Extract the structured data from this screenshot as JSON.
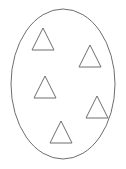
{
  "figure": {
    "background_color": "#ffffff",
    "stroke_color": "#6e6e6e",
    "fill_color": "none",
    "stroke_width": 1,
    "canvas": {
      "width": 126,
      "height": 169
    },
    "container": {
      "name": "ellipse",
      "shape": "ellipse",
      "cx": 63,
      "cy": 84,
      "rx": 52,
      "ry": 75,
      "stroke_color": "#6e6e6e",
      "fill_color": "#ffffff"
    },
    "shape_count": 5,
    "shape_kind": "triangle",
    "shapes": [
      {
        "index": 1,
        "name": "triangle-top-left",
        "kind": "triangle",
        "apex_x": 43,
        "apex_y": 28,
        "base_y": 50,
        "half_width": 11,
        "points": "43,28 32,50 54,50"
      },
      {
        "index": 2,
        "name": "triangle-upper-right",
        "kind": "triangle",
        "apex_x": 90,
        "apex_y": 45,
        "base_y": 67,
        "half_width": 11,
        "points": "90,45 79,67 101,67"
      },
      {
        "index": 3,
        "name": "triangle-middle-left",
        "kind": "triangle",
        "apex_x": 45,
        "apex_y": 76,
        "base_y": 98,
        "half_width": 11,
        "points": "45,76 34,98 56,98"
      },
      {
        "index": 4,
        "name": "triangle-lower-right",
        "kind": "triangle",
        "apex_x": 97,
        "apex_y": 96,
        "base_y": 118,
        "half_width": 11,
        "points": "97,96 86,118 108,118"
      },
      {
        "index": 5,
        "name": "triangle-bottom-center",
        "kind": "triangle",
        "apex_x": 61,
        "apex_y": 121,
        "base_y": 143,
        "half_width": 11,
        "points": "61,121 50,143 72,143"
      }
    ]
  }
}
